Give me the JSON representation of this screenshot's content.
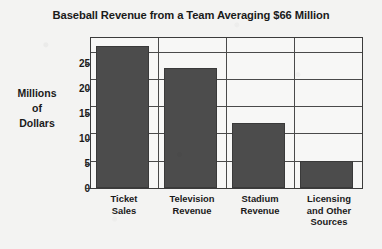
{
  "chart_data": {
    "type": "bar",
    "title": "Baseball Revenue from a Team Averaging $66 Million",
    "xlabel": "",
    "ylabel": "Millions of Dollars",
    "ylabel_lines": [
      "Millions",
      "of",
      "Dollars"
    ],
    "categories": [
      "Ticket Sales",
      "Television Revenue",
      "Stadium Revenue",
      "Licensing and Other Sources"
    ],
    "category_lines": [
      [
        "Ticket",
        "Sales"
      ],
      [
        "Television",
        "Revenue"
      ],
      [
        "Stadium",
        "Revenue"
      ],
      [
        "Licensing",
        "and Other",
        "Sources"
      ]
    ],
    "values": [
      26,
      22,
      12,
      5
    ],
    "ylim": [
      0,
      27.5
    ],
    "yticks": [
      0,
      5,
      10,
      15,
      20,
      25
    ],
    "ytick_labels": [
      "0",
      "5",
      "10",
      "15",
      "20",
      "25"
    ],
    "grid": true,
    "grid_axis": "both",
    "legend": "none",
    "bar_color": "#4c4c4c",
    "frame_color": "#3b3b3b",
    "background_color": "#f3f3f2",
    "text_color": "#1a1a1a"
  }
}
